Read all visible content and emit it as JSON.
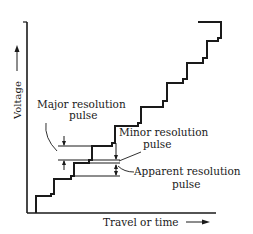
{
  "diagram": {
    "axes": {
      "y_label": "Voltage",
      "x_label": "Travel or time",
      "arrow_glyph": "→"
    },
    "annotations": {
      "major": {
        "line1": "Major resolution",
        "line2": "pulse"
      },
      "minor": {
        "line1": "Minor resolution",
        "line2": "pulse"
      },
      "apparent": {
        "line1": "Apparent resolution",
        "line2": "pulse"
      }
    },
    "colors": {
      "ink": "#1a1a1a",
      "background": "#ffffff"
    }
  }
}
